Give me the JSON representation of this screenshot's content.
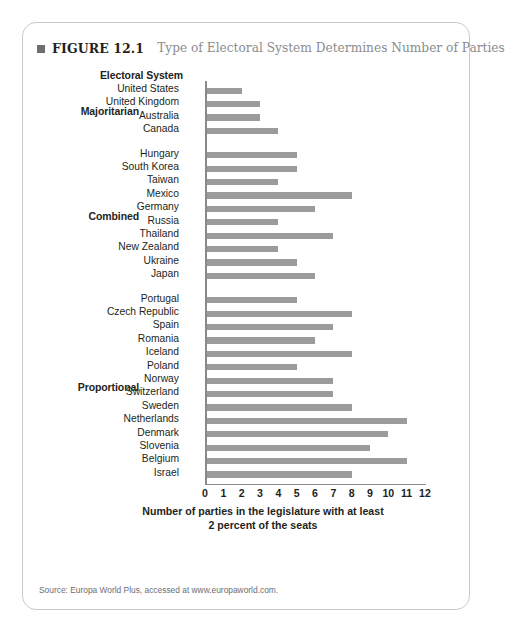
{
  "figure": {
    "marker": "■",
    "label": "FIGURE 12.1",
    "title": "Type of Electoral System Determines Number of Parties"
  },
  "axis_heading": "Electoral System",
  "source": "Source: Europa World Plus, accessed at www.europaworld.com.",
  "colors": {
    "bar": "#9b9b9b",
    "title_gray": "#8a8c8e",
    "text": "#231f20",
    "border": "#c9c9c9"
  },
  "chart_data": {
    "type": "bar",
    "orientation": "horizontal",
    "title": "Type of Electoral System Determines Number of Parties",
    "xlabel": "Number of parties in the legislature with at least 2 percent of the seats",
    "ylabel": "Electoral System",
    "xlim": [
      0,
      12
    ],
    "xticks": [
      0,
      1,
      2,
      3,
      4,
      5,
      6,
      7,
      8,
      9,
      10,
      11,
      12
    ],
    "grid": false,
    "legend": false,
    "groups": [
      {
        "name": "Majoritarian",
        "categories": [
          "United States",
          "United Kingdom",
          "Australia",
          "Canada"
        ],
        "values": [
          2,
          3,
          3,
          4
        ]
      },
      {
        "name": "Combined",
        "categories": [
          "Hungary",
          "South Korea",
          "Taiwan",
          "Mexico",
          "Germany",
          "Russia",
          "Thailand",
          "New Zealand",
          "Ukraine",
          "Japan"
        ],
        "values": [
          5,
          5,
          4,
          8,
          6,
          4,
          7,
          4,
          5,
          6
        ]
      },
      {
        "name": "Proportional",
        "categories": [
          "Portugal",
          "Czech Republic",
          "Spain",
          "Romania",
          "Iceland",
          "Poland",
          "Norway",
          "Switzerland",
          "Sweden",
          "Netherlands",
          "Denmark",
          "Slovenia",
          "Belgium",
          "Israel"
        ],
        "values": [
          5,
          8,
          7,
          6,
          8,
          5,
          7,
          7,
          8,
          11,
          10,
          9,
          11,
          8
        ]
      }
    ]
  },
  "axis_title_lines": [
    "Number of parties in the legislature with at least",
    "2 percent of the seats"
  ]
}
